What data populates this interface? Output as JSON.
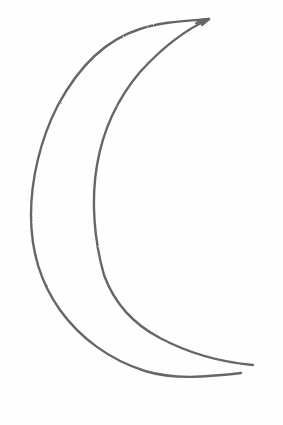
{
  "image": {
    "subject": "crescent moon pencil sketch",
    "background_color": "#fefefe",
    "stroke_color": "#5a5a5a",
    "shapes": [
      {
        "name": "outer-arc",
        "points": [
          [
            209,
            19
          ],
          [
            150,
            25
          ],
          [
            85,
            60
          ],
          [
            45,
            130
          ],
          [
            30,
            210
          ],
          [
            38,
            280
          ],
          [
            70,
            330
          ],
          [
            120,
            365
          ],
          [
            185,
            378
          ],
          [
            241,
            373
          ]
        ]
      },
      {
        "name": "inner-arc",
        "points": [
          [
            209,
            19
          ],
          [
            170,
            40
          ],
          [
            125,
            90
          ],
          [
            98,
            160
          ],
          [
            93,
            220
          ],
          [
            105,
            280
          ],
          [
            140,
            325
          ],
          [
            195,
            353
          ],
          [
            253,
            365
          ]
        ]
      }
    ]
  }
}
